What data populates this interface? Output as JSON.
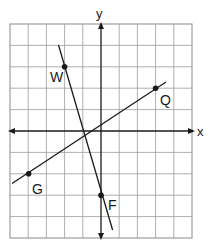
{
  "diagram": {
    "type": "coordinate-plane",
    "axes": {
      "x_label": "x",
      "y_label": "y",
      "x_range": [
        -5,
        5
      ],
      "y_range": [
        -5,
        5
      ],
      "grid": true
    },
    "points": [
      {
        "id": "W",
        "label": "W",
        "x": -2,
        "y": 3
      },
      {
        "id": "Q",
        "label": "Q",
        "x": 3,
        "y": 2
      },
      {
        "id": "G",
        "label": "G",
        "x": -4,
        "y": -2
      },
      {
        "id": "F",
        "label": "F",
        "x": 0,
        "y": -3
      }
    ],
    "lines": [
      {
        "id": "WF",
        "through": [
          "W",
          "F"
        ]
      },
      {
        "id": "GQ",
        "through": [
          "G",
          "Q"
        ]
      }
    ],
    "colors": {
      "grid": "#8a8a8a",
      "ink": "#1a1a1a",
      "background": "#ffffff"
    }
  }
}
